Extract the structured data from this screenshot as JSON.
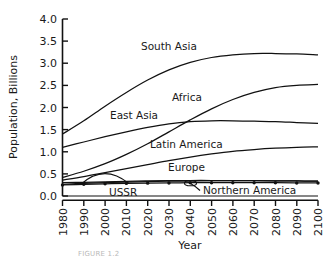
{
  "figure": {
    "caption_fragment": "FIGURE 1.2"
  },
  "chart_data": {
    "type": "line",
    "title": "",
    "xlabel": "Year",
    "ylabel": "Population, Billions",
    "xlim": [
      1980,
      2100
    ],
    "ylim": [
      0.0,
      4.0
    ],
    "grid": false,
    "legend_position": "inline-labels",
    "x": [
      1980,
      1990,
      2000,
      2010,
      2020,
      2030,
      2040,
      2050,
      2060,
      2070,
      2080,
      2090,
      2100
    ],
    "xtick_labels": [
      "1980",
      "1990",
      "2000",
      "2010",
      "2020",
      "2030",
      "2040",
      "2050",
      "2060",
      "2070",
      "2080",
      "2090",
      "2100"
    ],
    "ytick_labels": [
      "0.0",
      "0.5",
      "1.0",
      "1.5",
      "2.0",
      "2.5",
      "3.0",
      "3.5",
      "4.0"
    ],
    "ytick_values": [
      0.0,
      0.5,
      1.0,
      1.5,
      2.0,
      2.5,
      3.0,
      3.5,
      4.0
    ],
    "series": [
      {
        "name": "South Asia",
        "label": "South Asia",
        "style": "solid",
        "values": [
          1.4,
          1.7,
          2.03,
          2.34,
          2.62,
          2.85,
          3.02,
          3.13,
          3.19,
          3.22,
          3.22,
          3.21,
          3.19
        ]
      },
      {
        "name": "East Asia",
        "label": "East Asia",
        "style": "solid",
        "values": [
          1.1,
          1.22,
          1.34,
          1.45,
          1.55,
          1.63,
          1.68,
          1.7,
          1.7,
          1.69,
          1.68,
          1.66,
          1.64
        ]
      },
      {
        "name": "Africa",
        "label": "Africa",
        "style": "solid",
        "values": [
          0.42,
          0.56,
          0.73,
          0.94,
          1.18,
          1.45,
          1.72,
          1.97,
          2.18,
          2.34,
          2.45,
          2.5,
          2.52
        ]
      },
      {
        "name": "Latin America",
        "label": "Latin America",
        "style": "solid",
        "values": [
          0.36,
          0.44,
          0.53,
          0.62,
          0.71,
          0.8,
          0.88,
          0.95,
          1.01,
          1.05,
          1.08,
          1.1,
          1.11
        ]
      },
      {
        "name": "Europe",
        "label": "Europe",
        "style": "solid",
        "values": [
          0.3,
          0.31,
          0.32,
          0.33,
          0.34,
          0.345,
          0.35,
          0.35,
          0.35,
          0.345,
          0.34,
          0.34,
          0.335
        ]
      },
      {
        "name": "USSR",
        "label": "USSR",
        "style": "solid",
        "values": [
          0.265,
          0.285,
          0.3,
          0.315,
          0.325,
          0.335,
          0.34,
          0.345,
          0.345,
          0.345,
          0.34,
          0.34,
          0.335
        ]
      },
      {
        "name": "Northern America",
        "label": "Northern America",
        "style": "dotted-markers",
        "values": [
          0.25,
          0.265,
          0.275,
          0.285,
          0.29,
          0.295,
          0.3,
          0.3,
          0.3,
          0.3,
          0.3,
          0.295,
          0.295
        ]
      }
    ]
  }
}
